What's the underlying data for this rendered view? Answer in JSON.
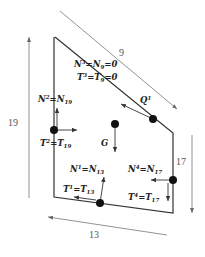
{
  "diagram": {
    "type": "free-body-diagram",
    "dimensions": [
      {
        "id": "top",
        "label": "9"
      },
      {
        "id": "left",
        "label": "19"
      },
      {
        "id": "right",
        "label": "17"
      },
      {
        "id": "bottom",
        "label": "13"
      }
    ],
    "labels": {
      "n3": {
        "main": "N",
        "sup": "3",
        "eq": "=",
        "main2": "N",
        "sub2": "9",
        "tail": "=0"
      },
      "t3": {
        "main": "T",
        "sup": "3",
        "eq": "=",
        "main2": "T",
        "sub2": "9",
        "tail": "=0"
      },
      "q1": {
        "main": "Q",
        "sup": "1"
      },
      "n2": {
        "main": "N",
        "sup": "2",
        "eq": "=",
        "main2": "N",
        "sub2": "19"
      },
      "t2": {
        "main": "T",
        "sup": "2",
        "eq": "=",
        "main2": "T",
        "sub2": "19"
      },
      "g": {
        "main": "G"
      },
      "n1": {
        "main": "N",
        "sup": "1",
        "eq": "=",
        "main2": "N",
        "sub2": "13"
      },
      "t1": {
        "main": "T",
        "sup": "1",
        "eq": "=",
        "main2": "T",
        "sub2": "13"
      },
      "n4": {
        "main": "N",
        "sup": "4",
        "eq": "=",
        "main2": "N",
        "sub2": "17"
      },
      "t4": {
        "main": "T",
        "sup": "4",
        "eq": "=",
        "main2": "T",
        "sub2": "17"
      }
    },
    "colors": {
      "line": "#333333",
      "dim_line": "#666666",
      "dot": "#111111"
    }
  }
}
